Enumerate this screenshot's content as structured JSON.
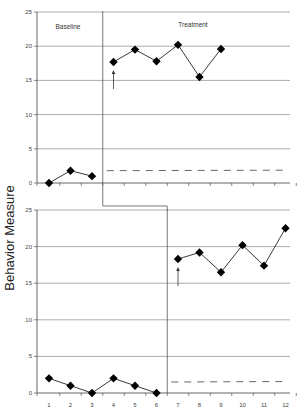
{
  "chart_data": [
    {
      "type": "line",
      "title": "",
      "ylabel": "Behavior Measure",
      "xlabel": "",
      "ylim": [
        0,
        25
      ],
      "yticks": [
        0,
        5,
        10,
        15,
        20,
        25
      ],
      "grid": true,
      "phases": [
        {
          "label": "Baseline",
          "sessions": [
            1,
            2,
            3
          ],
          "values": [
            0,
            1.8,
            1
          ]
        },
        {
          "label": "Treatment",
          "sessions": [
            4,
            5,
            6,
            7,
            8,
            9
          ],
          "values": [
            17.7,
            19.5,
            17.8,
            20.2,
            15.5,
            19.6
          ]
        }
      ],
      "dashed_line_value": 1.8,
      "intervention_arrow_at_session": 4
    },
    {
      "type": "line",
      "title": "",
      "ylabel": "Behavior Measure",
      "xlabel": "",
      "ylim": [
        0,
        25
      ],
      "yticks": [
        0,
        5,
        10,
        15,
        20,
        25
      ],
      "xticks": [
        1,
        2,
        3,
        4,
        5,
        6,
        7,
        8,
        9,
        10,
        11,
        12
      ],
      "grid": true,
      "phases": [
        {
          "label": "Baseline",
          "sessions": [
            1,
            2,
            3,
            4,
            5,
            6
          ],
          "values": [
            2,
            1,
            0,
            2,
            1,
            0
          ]
        },
        {
          "label": "Treatment",
          "sessions": [
            7,
            8,
            9,
            10,
            11,
            12
          ],
          "values": [
            18.3,
            19.2,
            16.5,
            20.2,
            17.4,
            22.5
          ]
        }
      ],
      "dashed_line_value": 1.5,
      "intervention_arrow_at_session": 7
    }
  ],
  "labels": {
    "y_axis": "Behavior Measure",
    "baseline": "Baseline",
    "treatment": "Treatment"
  }
}
